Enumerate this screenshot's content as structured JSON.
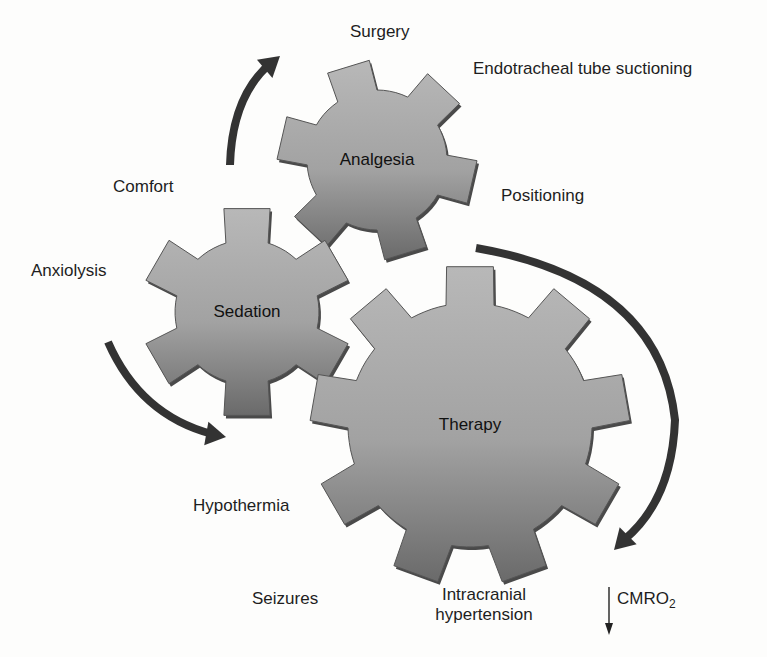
{
  "diagram": {
    "type": "interlocking-gears",
    "colors": {
      "gear_light": "#b4b4b4",
      "gear_dark": "#6e6e6e",
      "gear_edge": "#555555",
      "arrow": "#333333",
      "background": "#fdfdfc"
    }
  },
  "gears": [
    {
      "id": "analgesia",
      "label": "Analgesia",
      "cx": 377,
      "cy": 160,
      "outer": 100,
      "root": 70,
      "teeth": 6,
      "start_deg": -107,
      "tooth_frac": 0.42
    },
    {
      "id": "sedation",
      "label": "Sedation",
      "cx": 247,
      "cy": 312,
      "outer": 106,
      "root": 72,
      "teeth": 6,
      "start_deg": -90,
      "tooth_frac": 0.42
    },
    {
      "id": "therapy",
      "label": "Therapy",
      "cx": 470,
      "cy": 425,
      "outer": 160,
      "root": 122,
      "teeth": 9,
      "start_deg": -90,
      "tooth_frac": 0.42
    }
  ],
  "labels": {
    "surgery": "Surgery",
    "endotracheal": "Endotracheal tube suctioning",
    "comfort": "Comfort",
    "positioning": "Positioning",
    "anxiolysis": "Anxiolysis",
    "hypothermia": "Hypothermia",
    "seizures": "Seizures",
    "intracranial_1": "Intracranial",
    "intracranial_2": "hypertension",
    "cmro2_main": "CMRO",
    "cmro2_sub": "2",
    "cmro2_prefix_symbol": "↓"
  },
  "arrows": [
    {
      "id": "top-left-arrow",
      "path": "M230 165 Q232 95 272 62",
      "tip": [
        280,
        56
      ],
      "dir_deg": -40
    },
    {
      "id": "left-arrow",
      "path": "M108 342 Q140 415 212 434",
      "tip": [
        226,
        437
      ],
      "dir_deg": 10
    },
    {
      "id": "right-arrow",
      "path": "M476 248 Q660 280 675 420 Q672 500 624 540",
      "tip": [
        614,
        550
      ],
      "dir_deg": 135
    }
  ]
}
